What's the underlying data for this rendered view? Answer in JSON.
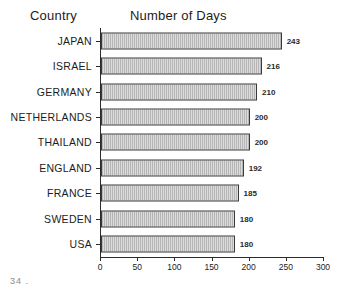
{
  "header": {
    "category_header": "Country",
    "value_header": "Number of Days"
  },
  "footer": {
    "page_note": "34 ."
  },
  "chart_data": {
    "type": "bar",
    "orientation": "horizontal",
    "title": "Number of Days",
    "xlabel": "",
    "ylabel": "Country",
    "xlim": [
      0,
      300
    ],
    "xticks": [
      0,
      50,
      100,
      150,
      200,
      250,
      300
    ],
    "grid": false,
    "legend": null,
    "show_value_labels": true,
    "categories": [
      "JAPAN",
      "ISRAEL",
      "GERMANY",
      "NETHERLANDS",
      "THAILAND",
      "ENGLAND",
      "FRANCE",
      "SWEDEN",
      "USA"
    ],
    "values": [
      243,
      216,
      210,
      200,
      200,
      192,
      185,
      180,
      180
    ],
    "bar_fill": "#b6b6b6",
    "bar_border": "#3a3a3a"
  }
}
